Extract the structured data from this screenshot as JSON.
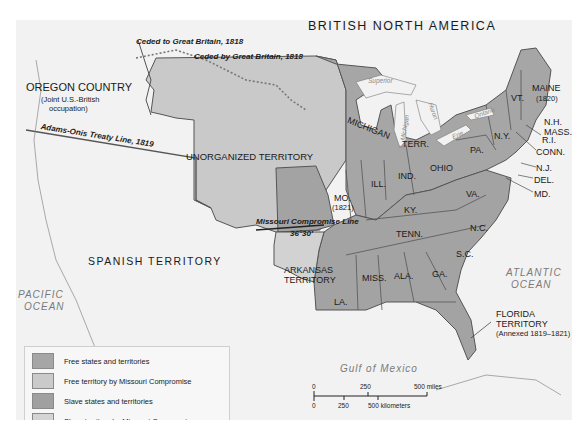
{
  "map": {
    "colors": {
      "background": "#f2f2f2",
      "water": "#f2f2f2",
      "free_states": "#a6a6a6",
      "free_territory": "#c9c9c9",
      "slave_states": "#a3a3a3",
      "slave_territory": "#d2d2d2",
      "foreign": "#f2f2f2",
      "border": "#555555"
    },
    "labels": {
      "british_north_america": "BRITISH NORTH AMERICA",
      "oregon_country": "OREGON COUNTRY",
      "oregon_note_1": "(Joint U.S.-British",
      "oregon_note_2": "occupation)",
      "unorganized_territory": "UNORGANIZED TERRITORY",
      "spanish_territory": "SPANISH TERRITORY",
      "arkansas_1": "ARKANSAS",
      "arkansas_2": "TERRITORY",
      "florida_1": "FLORIDA",
      "florida_2": "TERRITORY",
      "florida_note": "(Annexed 1819–1821)",
      "pacific_1": "PACIFIC",
      "pacific_2": "OCEAN",
      "atlantic_1": "ATLANTIC",
      "atlantic_2": "OCEAN",
      "gulf": "Gulf of Mexico",
      "lake_superior": "Superior",
      "lake_michigan": "L. Michigan",
      "lake_huron": "Huron",
      "lake_erie": "Erie",
      "lake_ontario": "Ontario"
    },
    "treaty_lines": {
      "ceded_to": "Ceded to Great Britain, 1818",
      "ceded_by": "Ceded by Great Britain, 1818",
      "adams_onis": "Adams-Onis Treaty Line, 1819",
      "missouri_line": "Missouri Compromise Line",
      "parallel": "36°30′"
    },
    "states": {
      "maine": "MAINE",
      "maine_year": "(1820)",
      "vt": "VT.",
      "nh": "N.H.",
      "mass": "MASS.",
      "ri": "R.I.",
      "conn": "CONN.",
      "ny": "N.Y.",
      "nj": "N.J.",
      "del": "DEL.",
      "md": "MD.",
      "pa": "PA.",
      "va": "VA.",
      "nc": "N.C.",
      "sc": "S.C.",
      "ga": "GA.",
      "ala": "ALA.",
      "miss": "MISS.",
      "la": "LA.",
      "tenn": "TENN.",
      "ky": "KY.",
      "ohio": "OHIO",
      "ind": "IND.",
      "ill": "ILL.",
      "mo": "MO.",
      "mo_year": "(1821)",
      "michigan": "MICHIGAN",
      "terr": "TERR."
    },
    "legend": [
      {
        "label": "Free states and territories",
        "color": "#a6a6a6"
      },
      {
        "label": "Free territory by Missouri Compromise",
        "color": "#cacaca"
      },
      {
        "label": "Slave states and territories",
        "color": "#a0a0a0"
      },
      {
        "label": "Slave territory by Missouri Compromise",
        "color": "#d4d4d4"
      }
    ],
    "scale": {
      "miles_0": "0",
      "miles_250": "250",
      "miles_500": "500 miles",
      "km_0": "0",
      "km_250": "250",
      "km_500": "500 kilometers"
    }
  }
}
